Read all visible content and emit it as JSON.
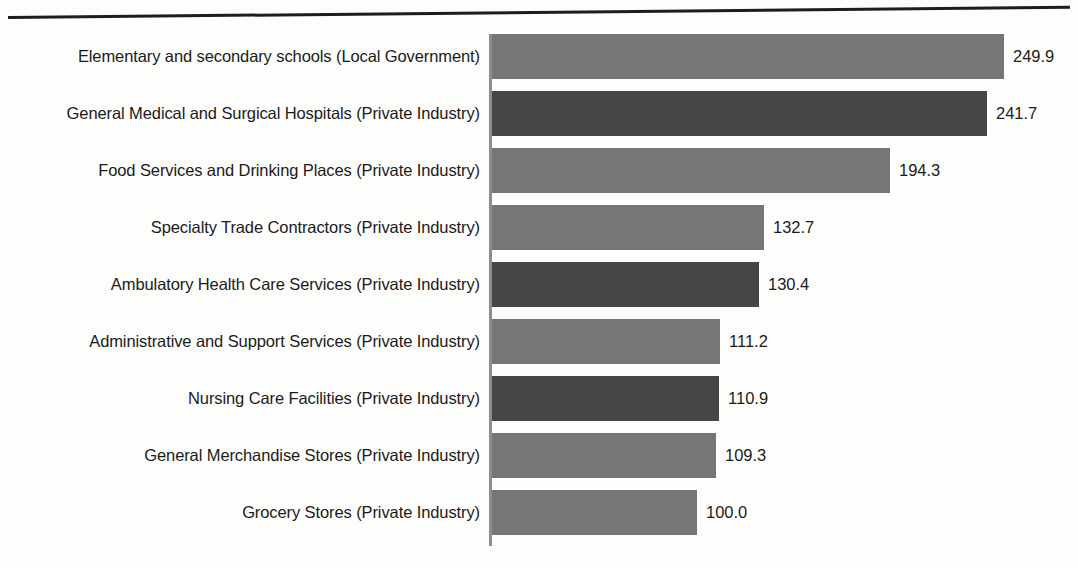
{
  "chart_data": {
    "type": "bar",
    "orientation": "horizontal",
    "title": "",
    "xlabel": "",
    "ylabel": "",
    "xlim": [
      0,
      249.9
    ],
    "grid": false,
    "legend": null,
    "value_labels_shown": true,
    "categories": [
      "Elementary and secondary schools (Local Government)",
      "General Medical and Surgical Hospitals (Private Industry)",
      "Food Services and Drinking Places (Private Industry)",
      "Specialty Trade Contractors (Private Industry)",
      "Ambulatory Health Care Services (Private Industry)",
      "Administrative and Support Services (Private Industry)",
      "Nursing Care Facilities (Private Industry)",
      "General Merchandise Stores (Private Industry)",
      "Grocery Stores (Private Industry)"
    ],
    "values": [
      249.9,
      241.7,
      194.3,
      132.7,
      130.4,
      111.2,
      110.9,
      109.3,
      100.0
    ],
    "value_labels": [
      "249.9",
      "241.7",
      "194.3",
      "132.7",
      "130.4",
      "111.2",
      "110.9",
      "109.3",
      "100.0"
    ],
    "bar_shades": [
      "light",
      "dark",
      "light",
      "light",
      "dark",
      "light",
      "dark",
      "light",
      "light"
    ],
    "colors": {
      "bar_light": "#767676",
      "bar_dark": "#464646",
      "text": "#1b1b1b",
      "axis_line": "#8d8d8d",
      "rule": "#1d1d1d",
      "background": "#fdfdfc"
    }
  }
}
